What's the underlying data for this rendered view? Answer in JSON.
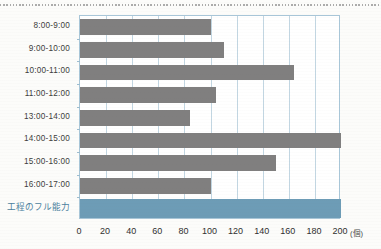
{
  "chart_data": {
    "type": "bar",
    "orientation": "horizontal",
    "title": "",
    "xlabel": "(個)",
    "ylabel": "",
    "xlim": [
      0,
      200
    ],
    "xticks": [
      0,
      20,
      40,
      60,
      80,
      100,
      120,
      140,
      160,
      180,
      200
    ],
    "grid": true,
    "legend": null,
    "categories": [
      "8:00-9:00",
      "9:00-10:00",
      "10:00-11:00",
      "11:00-12:00",
      "13:00-14:00",
      "14:00-15:00",
      "15:00-16:00",
      "16:00-17:00",
      "工程のフル能力"
    ],
    "values": [
      100,
      110,
      164,
      104,
      84,
      200,
      150,
      100,
      200
    ],
    "bar_colors": [
      "#807f7f",
      "#807f7f",
      "#807f7f",
      "#807f7f",
      "#807f7f",
      "#807f7f",
      "#807f7f",
      "#807f7f",
      "#6d9cb6"
    ],
    "unit_note": "(個)"
  },
  "axis": {
    "unit_label": "(個)",
    "tick_labels": [
      "0",
      "20",
      "40",
      "60",
      "80",
      "100",
      "120",
      "140",
      "160",
      "180",
      "200"
    ]
  },
  "rows": [
    {
      "label": "8:00-9:00",
      "value": 100,
      "kind": "hour"
    },
    {
      "label": "9:00-10:00",
      "value": 110,
      "kind": "hour"
    },
    {
      "label": "10:00-11:00",
      "value": 164,
      "kind": "hour"
    },
    {
      "label": "11:00-12:00",
      "value": 104,
      "kind": "hour"
    },
    {
      "label": "13:00-14:00",
      "value": 84,
      "kind": "hour"
    },
    {
      "label": "14:00-15:00",
      "value": 200,
      "kind": "hour"
    },
    {
      "label": "15:00-16:00",
      "value": 150,
      "kind": "hour"
    },
    {
      "label": "16:00-17:00",
      "value": 100,
      "kind": "hour"
    },
    {
      "label": "工程のフル能力",
      "value": 200,
      "kind": "capacity"
    }
  ],
  "colors": {
    "bar": "#807f7f",
    "capacity_bar": "#6d9cb6",
    "capacity_text": "#4b7f9e",
    "grid": "#c2d6e2",
    "plot_border": "#a8c6d8",
    "paper": "#fcfcfa"
  }
}
